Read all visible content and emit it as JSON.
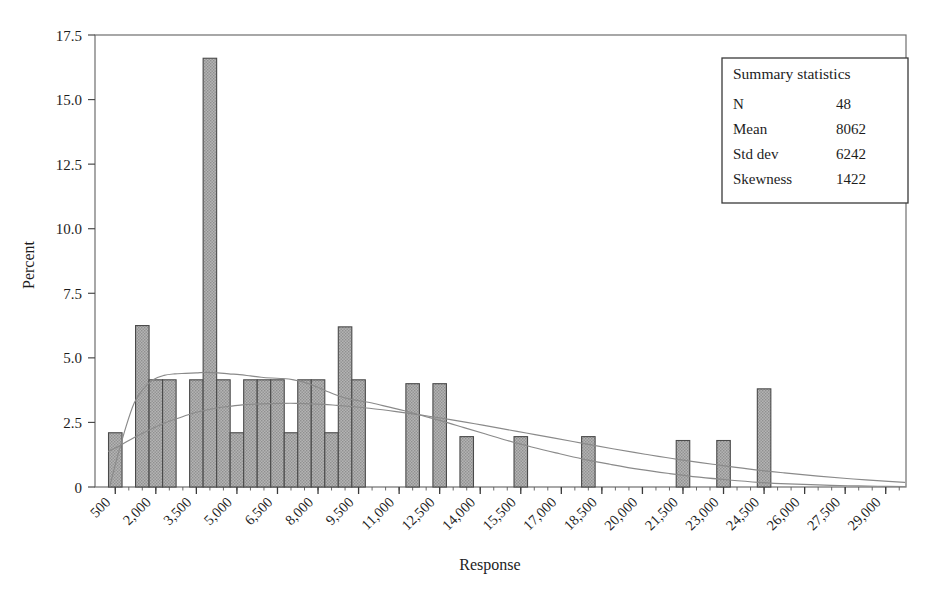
{
  "chart_data": {
    "type": "bar",
    "title": "",
    "xlabel": "Response",
    "ylabel": "Percent",
    "ylim": [
      0,
      17.5
    ],
    "xlim": [
      -250,
      29750
    ],
    "yticks": [
      "0",
      "2.5",
      "5.0",
      "7.5",
      "10.0",
      "12.5",
      "15.0",
      "17.5"
    ],
    "ytick_values": [
      0,
      2.5,
      5.0,
      7.5,
      10.0,
      12.5,
      15.0,
      17.5
    ],
    "xtick_labels": [
      "500",
      "2,000",
      "3,500",
      "5,000",
      "6,500",
      "8,000",
      "9,500",
      "11,000",
      "12,500",
      "14,000",
      "15,500",
      "17,000",
      "18,500",
      "20,000",
      "21,500",
      "23,000",
      "24,500",
      "26,000",
      "27,500",
      "29,000"
    ],
    "xtick_values": [
      500,
      2000,
      3500,
      5000,
      6500,
      8000,
      9500,
      11000,
      12500,
      14000,
      15500,
      17000,
      18500,
      20000,
      21500,
      23000,
      24500,
      26000,
      27500,
      29000
    ],
    "bin_width": 500,
    "grid": false,
    "legend": "none",
    "bar_fill": "#a8a8a8",
    "bar_edge": "#4a4a4a",
    "bars": [
      {
        "center": 500,
        "value": 2.1
      },
      {
        "center": 1000,
        "value": 0.0
      },
      {
        "center": 1500,
        "value": 6.25
      },
      {
        "center": 2000,
        "value": 4.15
      },
      {
        "center": 2500,
        "value": 4.15
      },
      {
        "center": 3000,
        "value": 0.0
      },
      {
        "center": 3500,
        "value": 4.15
      },
      {
        "center": 4000,
        "value": 16.6
      },
      {
        "center": 4500,
        "value": 4.15
      },
      {
        "center": 5000,
        "value": 2.1
      },
      {
        "center": 5500,
        "value": 4.15
      },
      {
        "center": 6000,
        "value": 4.15
      },
      {
        "center": 6500,
        "value": 4.15
      },
      {
        "center": 7000,
        "value": 2.1
      },
      {
        "center": 7500,
        "value": 4.15
      },
      {
        "center": 8000,
        "value": 4.15
      },
      {
        "center": 8500,
        "value": 2.1
      },
      {
        "center": 9000,
        "value": 6.2
      },
      {
        "center": 9500,
        "value": 4.15
      },
      {
        "center": 10000,
        "value": 0.0
      },
      {
        "center": 10500,
        "value": 0.0
      },
      {
        "center": 11000,
        "value": 0.0
      },
      {
        "center": 11500,
        "value": 4.0
      },
      {
        "center": 12000,
        "value": 0.0
      },
      {
        "center": 12500,
        "value": 4.0
      },
      {
        "center": 13000,
        "value": 0.0
      },
      {
        "center": 13500,
        "value": 1.95
      },
      {
        "center": 14000,
        "value": 0.0
      },
      {
        "center": 14500,
        "value": 0.0
      },
      {
        "center": 15000,
        "value": 0.0
      },
      {
        "center": 15500,
        "value": 1.95
      },
      {
        "center": 16000,
        "value": 0.0
      },
      {
        "center": 16500,
        "value": 0.0
      },
      {
        "center": 17000,
        "value": 0.0
      },
      {
        "center": 17500,
        "value": 0.0
      },
      {
        "center": 18000,
        "value": 1.95
      },
      {
        "center": 18500,
        "value": 0.0
      },
      {
        "center": 19000,
        "value": 0.0
      },
      {
        "center": 19500,
        "value": 0.0
      },
      {
        "center": 20000,
        "value": 0.0
      },
      {
        "center": 20500,
        "value": 0.0
      },
      {
        "center": 21000,
        "value": 0.0
      },
      {
        "center": 21500,
        "value": 1.8
      },
      {
        "center": 22000,
        "value": 0.0
      },
      {
        "center": 22500,
        "value": 0.0
      },
      {
        "center": 23000,
        "value": 1.8
      },
      {
        "center": 23500,
        "value": 0.0
      },
      {
        "center": 24000,
        "value": 0.0
      },
      {
        "center": 24500,
        "value": 3.8
      },
      {
        "center": 25000,
        "value": 0.0
      },
      {
        "center": 25500,
        "value": 0.0
      },
      {
        "center": 26000,
        "value": 0.0
      },
      {
        "center": 27000,
        "value": 0.0
      },
      {
        "center": 28000,
        "value": 0.0
      },
      {
        "center": 29000,
        "value": 0.0
      }
    ],
    "curves": [
      {
        "name": "kernel-density",
        "color": "#8a8a8a",
        "points": [
          [
            300,
            0.05
          ],
          [
            600,
            1.25
          ],
          [
            900,
            2.35
          ],
          [
            1200,
            3.25
          ],
          [
            1500,
            3.75
          ],
          [
            1900,
            4.15
          ],
          [
            2300,
            4.32
          ],
          [
            2700,
            4.38
          ],
          [
            3100,
            4.4
          ],
          [
            3500,
            4.42
          ],
          [
            3900,
            4.44
          ],
          [
            4300,
            4.42
          ],
          [
            4700,
            4.38
          ],
          [
            5100,
            4.35
          ],
          [
            5500,
            4.3
          ],
          [
            5900,
            4.25
          ],
          [
            6300,
            4.22
          ],
          [
            6700,
            4.2
          ],
          [
            7100,
            4.15
          ],
          [
            7500,
            4.05
          ],
          [
            7900,
            3.9
          ],
          [
            8300,
            3.72
          ],
          [
            8700,
            3.55
          ],
          [
            9100,
            3.42
          ],
          [
            9500,
            3.34
          ],
          [
            10000,
            3.25
          ],
          [
            10600,
            3.1
          ],
          [
            11200,
            2.95
          ],
          [
            11900,
            2.75
          ],
          [
            12600,
            2.55
          ],
          [
            13400,
            2.3
          ],
          [
            14200,
            2.05
          ],
          [
            15000,
            1.8
          ],
          [
            15900,
            1.55
          ],
          [
            16800,
            1.32
          ],
          [
            17800,
            1.08
          ],
          [
            18800,
            0.88
          ],
          [
            19900,
            0.68
          ],
          [
            21000,
            0.52
          ],
          [
            22100,
            0.38
          ],
          [
            23200,
            0.27
          ],
          [
            24300,
            0.18
          ],
          [
            25400,
            0.12
          ],
          [
            26500,
            0.08
          ],
          [
            27600,
            0.05
          ],
          [
            28700,
            0.03
          ],
          [
            29700,
            0.02
          ]
        ]
      },
      {
        "name": "fitted-distribution",
        "color": "#8a8a8a",
        "points": [
          [
            250,
            1.38
          ],
          [
            700,
            1.62
          ],
          [
            1200,
            1.92
          ],
          [
            1700,
            2.18
          ],
          [
            2200,
            2.42
          ],
          [
            2700,
            2.62
          ],
          [
            3200,
            2.8
          ],
          [
            3700,
            2.94
          ],
          [
            4200,
            3.05
          ],
          [
            4700,
            3.12
          ],
          [
            5200,
            3.18
          ],
          [
            5700,
            3.21
          ],
          [
            6200,
            3.23
          ],
          [
            6700,
            3.24
          ],
          [
            7200,
            3.24
          ],
          [
            7700,
            3.22
          ],
          [
            8200,
            3.2
          ],
          [
            8700,
            3.16
          ],
          [
            9300,
            3.11
          ],
          [
            9900,
            3.05
          ],
          [
            10600,
            2.96
          ],
          [
            11300,
            2.86
          ],
          [
            12100,
            2.74
          ],
          [
            12900,
            2.61
          ],
          [
            13800,
            2.45
          ],
          [
            14700,
            2.28
          ],
          [
            15700,
            2.09
          ],
          [
            16700,
            1.9
          ],
          [
            17800,
            1.69
          ],
          [
            18900,
            1.48
          ],
          [
            20100,
            1.27
          ],
          [
            21300,
            1.07
          ],
          [
            22600,
            0.88
          ],
          [
            23900,
            0.7
          ],
          [
            25200,
            0.55
          ],
          [
            26500,
            0.42
          ],
          [
            27800,
            0.31
          ],
          [
            29100,
            0.22
          ],
          [
            29700,
            0.18
          ]
        ]
      }
    ]
  },
  "summary_box": {
    "title": "Summary statistics",
    "rows": [
      {
        "label": "N",
        "value": "48"
      },
      {
        "label": "Mean",
        "value": "8062"
      },
      {
        "label": "Std dev",
        "value": "6242"
      },
      {
        "label": "Skewness",
        "value": "1422"
      }
    ]
  }
}
